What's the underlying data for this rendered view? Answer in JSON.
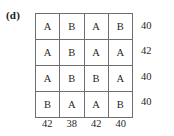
{
  "figure": {
    "panel_label": "(d)",
    "colors": {
      "background": "#ffffff",
      "outer_border": "#3a3a3a",
      "inner_gridline": "#6e6e6e",
      "text": "#1f1f1f"
    }
  },
  "chart_data": {
    "type": "table",
    "title": "(d)",
    "xlabel": "",
    "ylabel": "",
    "grid": true,
    "legend": "none",
    "columns": [
      "1",
      "2",
      "3",
      "4"
    ],
    "rows": [
      "1",
      "2",
      "3",
      "4"
    ],
    "cells": [
      [
        "A",
        "B",
        "A",
        "B"
      ],
      [
        "A",
        "B",
        "A",
        "A"
      ],
      [
        "A",
        "B",
        "B",
        "A"
      ],
      [
        "B",
        "A",
        "A",
        "B"
      ]
    ],
    "row_totals": [
      40,
      42,
      40,
      40
    ],
    "column_totals": [
      42,
      38,
      42,
      40
    ],
    "row_totals_label": "",
    "column_totals_label": "",
    "annotations": []
  },
  "matrix": {
    "rows": [
      {
        "cells": [
          "A",
          "B",
          "A",
          "B"
        ],
        "total": "40"
      },
      {
        "cells": [
          "A",
          "B",
          "A",
          "A"
        ],
        "total": "42"
      },
      {
        "cells": [
          "A",
          "B",
          "B",
          "A"
        ],
        "total": "40"
      },
      {
        "cells": [
          "B",
          "A",
          "A",
          "B"
        ],
        "total": "40"
      }
    ],
    "column_totals": [
      "42",
      "38",
      "42",
      "40"
    ]
  }
}
